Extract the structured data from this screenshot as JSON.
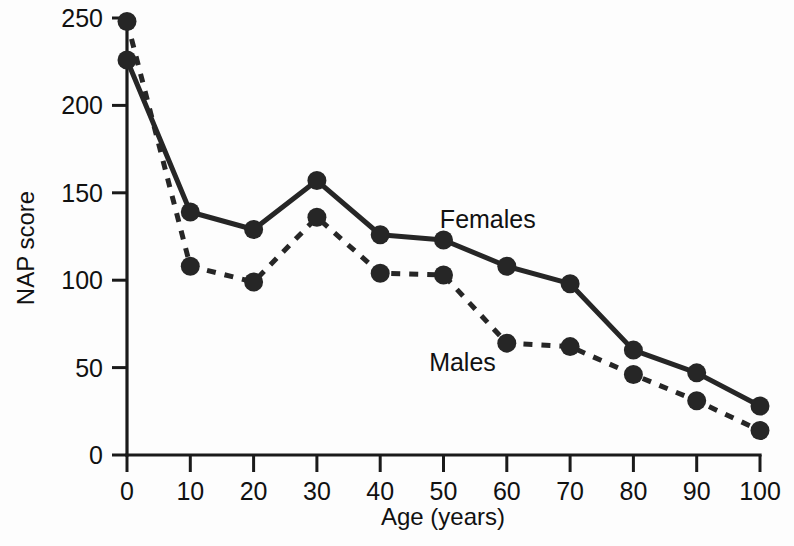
{
  "chart_data": {
    "type": "line",
    "title": "",
    "xlabel": "Age (years)",
    "ylabel": "NAP score",
    "xlim": [
      0,
      100
    ],
    "ylim": [
      0,
      250
    ],
    "xticks": [
      0,
      10,
      20,
      30,
      40,
      50,
      60,
      70,
      80,
      90,
      100
    ],
    "yticks": [
      0,
      50,
      100,
      150,
      200,
      250
    ],
    "grid": false,
    "legend_position": "inline-annotation",
    "x": [
      0,
      10,
      20,
      30,
      40,
      50,
      60,
      70,
      80,
      90,
      100
    ],
    "series": [
      {
        "name": "Females",
        "style": "solid",
        "marker": "filled-circle",
        "color": "#262626",
        "values": [
          226,
          139,
          129,
          157,
          126,
          123,
          108,
          98,
          60,
          47,
          28
        ]
      },
      {
        "name": "Males",
        "style": "dashed",
        "marker": "filled-circle",
        "color": "#262626",
        "values": [
          248,
          108,
          99,
          136,
          104,
          103,
          64,
          62,
          46,
          31,
          14
        ]
      }
    ],
    "annotations": [
      {
        "text": "Females",
        "x": 57,
        "y": 130
      },
      {
        "text": "Males",
        "x": 53,
        "y": 48
      }
    ]
  },
  "axes": {
    "x_tick_labels": [
      "0",
      "10",
      "20",
      "30",
      "40",
      "50",
      "60",
      "70",
      "80",
      "90",
      "100"
    ],
    "y_tick_labels": [
      "0",
      "50",
      "100",
      "150",
      "200",
      "250"
    ],
    "x_title": "Age (years)",
    "y_title": "NAP score"
  },
  "colors": {
    "ink": "#262626",
    "axis": "#1a1a1a",
    "background": "#fdfdfd"
  }
}
